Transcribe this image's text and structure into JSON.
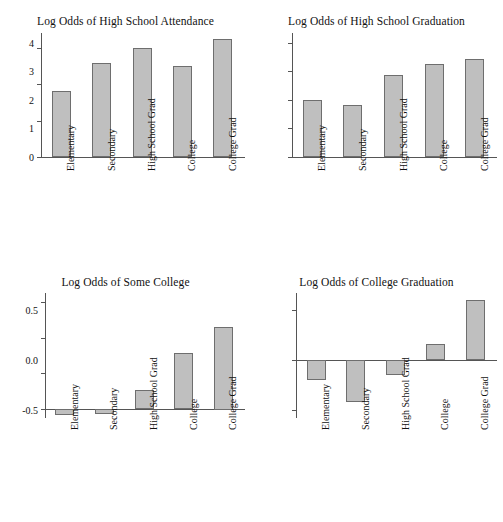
{
  "figure": {
    "categories": [
      "Elementary",
      "Secondary",
      "High School Grad",
      "College",
      "College Grad"
    ],
    "bar_fill": "#bfbfbf",
    "bar_edge": "#6e6e6e",
    "axis_color": "#555555"
  },
  "chart_data": [
    {
      "type": "bar",
      "title": "Log Odds of High School Attendance",
      "xlabel": "",
      "ylabel": "",
      "categories": [
        "Elementary",
        "Secondary",
        "High School Grad",
        "College",
        "College Grad"
      ],
      "values": [
        3.6,
        5.15,
        5.95,
        5.0,
        6.45
      ],
      "yticks": [
        0,
        2,
        4,
        6
      ],
      "ytick_labels": [
        "0",
        "2",
        "4",
        "6"
      ],
      "ylim": [
        0,
        6.8
      ],
      "grid": false,
      "legend": "none"
    },
    {
      "type": "bar",
      "title": "Log Odds of High School Graduation",
      "xlabel": "",
      "ylabel": "",
      "categories": [
        "Elementary",
        "Secondary",
        "High School Grad",
        "College",
        "College Grad"
      ],
      "values": [
        2.0,
        1.83,
        2.88,
        3.28,
        3.45
      ],
      "yticks": [
        0,
        1,
        2,
        3,
        4
      ],
      "ytick_labels": [
        "0",
        "1",
        "2",
        "3",
        "4"
      ],
      "ylim": [
        0,
        4.35
      ],
      "grid": false,
      "legend": "none"
    },
    {
      "type": "bar",
      "title": "Log Odds of Some College",
      "xlabel": "",
      "ylabel": "",
      "categories": [
        "Elementary",
        "Secondary",
        "High School Grad",
        "College",
        "College Grad"
      ],
      "values": [
        -0.08,
        -0.07,
        0.27,
        0.78,
        1.15
      ],
      "yticks": [
        0.0,
        0.5,
        1.0,
        1.5
      ],
      "ytick_labels": [
        "0.0",
        "0.5",
        "1.0",
        "1.5"
      ],
      "ylim": [
        -0.12,
        1.62
      ],
      "grid": false,
      "legend": "none"
    },
    {
      "type": "bar",
      "title": "Log Odds of College Graduation",
      "xlabel": "",
      "ylabel": "",
      "categories": [
        "Elementary",
        "Secondary",
        "High School Grad",
        "College",
        "College Grad"
      ],
      "values": [
        -0.2,
        -0.42,
        -0.15,
        0.16,
        0.6
      ],
      "yticks": [
        -0.5,
        0.0,
        0.5
      ],
      "ytick_labels": [
        "-0.5",
        "0.0",
        "0.5"
      ],
      "ylim": [
        -0.58,
        0.67
      ],
      "grid": false,
      "legend": "none"
    }
  ]
}
